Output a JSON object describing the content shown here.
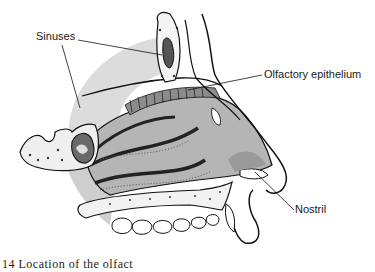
{
  "diagram": {
    "labels": [
      {
        "id": "sinuses",
        "text": "Sinuses",
        "x": 36,
        "y": 31
      },
      {
        "id": "olfactory",
        "text": "Olfactory epithelium",
        "x": 264,
        "y": 69
      },
      {
        "id": "nostril",
        "text": "Nostril",
        "x": 295,
        "y": 204
      }
    ],
    "caption": "14 Location of the olfact",
    "colors": {
      "line": "#111111",
      "cavity_fill": "#b8b8b8",
      "halo_fill": "#d9d9d9",
      "bone_fill": "#f4f4f4",
      "background": "#ffffff"
    }
  }
}
